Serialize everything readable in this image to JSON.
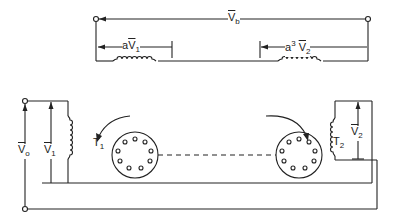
{
  "diagram": {
    "type": "circuit-schematic",
    "labels": {
      "vb": {
        "base": "V",
        "sub": "b"
      },
      "av1": {
        "prefix": "a",
        "base": "V",
        "sub": "1"
      },
      "a3v2": {
        "prefix": "a",
        "sup": "3",
        "base": "V",
        "sub": "2"
      },
      "v0": {
        "base": "V",
        "sub": "o"
      },
      "v1": {
        "base": "V",
        "sub": "1"
      },
      "v2": {
        "base": "V",
        "sub": "2"
      },
      "t1": {
        "base": "T",
        "sub": "1"
      },
      "t2": {
        "base": "T",
        "sub": "2"
      }
    },
    "components": [
      {
        "id": "series-coil-1",
        "kind": "coil",
        "orientation": "horizontal"
      },
      {
        "id": "series-coil-2",
        "kind": "coil",
        "orientation": "horizontal"
      },
      {
        "id": "stator-coil-1",
        "kind": "coil",
        "orientation": "vertical"
      },
      {
        "id": "stator-coil-2",
        "kind": "coil",
        "orientation": "vertical"
      },
      {
        "id": "rotor-1",
        "kind": "rotor",
        "slots": 10,
        "rotation": "counterclockwise"
      },
      {
        "id": "rotor-2",
        "kind": "rotor",
        "slots": 10,
        "rotation": "clockwise"
      }
    ],
    "colors": {
      "line": "#222222",
      "background": "#ffffff"
    }
  }
}
